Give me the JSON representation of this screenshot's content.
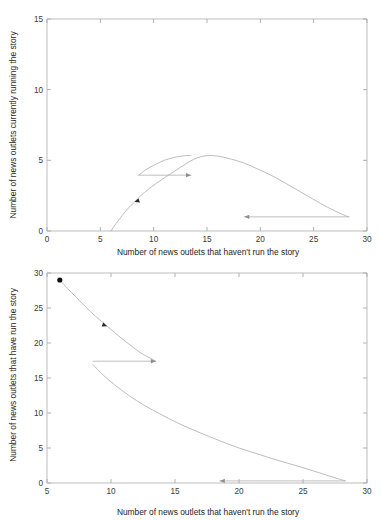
{
  "figure": {
    "background_color": "#ffffff",
    "curve_color": "#b0b0b0",
    "axis_color": "#b6b6b6",
    "marker_color": "#111111",
    "panel_count": 2
  },
  "chart_data": [
    {
      "type": "line",
      "panel": "top",
      "title": "",
      "xlabel": "Number of news outlets that haven't run the story",
      "ylabel": "Number of news outlets currently running the story",
      "xlim": [
        0,
        30
      ],
      "ylim": [
        0,
        15
      ],
      "xticks": [
        0,
        5,
        10,
        15,
        20,
        25,
        30
      ],
      "xticklabels": [
        "0",
        "5",
        "10",
        "15",
        "20",
        "25",
        "30"
      ],
      "yticks": [
        0,
        5,
        10,
        15
      ],
      "yticklabels": [
        "0",
        "5",
        "10",
        "15"
      ],
      "grid": false,
      "legend": false,
      "series": [
        {
          "name": "trajectory-rise",
          "comment": "outbreak growth branch from origin up over the hump and down to the right",
          "x": [
            6.0,
            6.3,
            6.7,
            7.1,
            7.6,
            8.2,
            8.8,
            9.5,
            10.3,
            11.2,
            12.1,
            13.0,
            14.0,
            15.0,
            16.0,
            17.2,
            18.5,
            20.0,
            21.5,
            23.0,
            24.5,
            26.0,
            27.2,
            28.0,
            28.3
          ],
          "y": [
            0.0,
            0.35,
            0.75,
            1.15,
            1.6,
            2.05,
            2.5,
            2.95,
            3.4,
            3.85,
            4.3,
            4.75,
            5.15,
            5.33,
            5.3,
            5.1,
            4.8,
            4.3,
            3.75,
            3.1,
            2.45,
            1.8,
            1.35,
            1.08,
            1.0
          ]
        },
        {
          "name": "trajectory-upper-branch",
          "comment": "second pass branch ending at the jump point",
          "x": [
            8.6,
            9.2,
            10.0,
            11.0,
            12.0,
            13.0,
            13.5
          ],
          "y": [
            3.95,
            4.3,
            4.65,
            5.0,
            5.22,
            5.33,
            5.35
          ]
        },
        {
          "name": "jump-segment-upper",
          "comment": "horizontal reset jump, rightward to leftward at y = 3.95",
          "x": [
            13.5,
            8.6
          ],
          "y": [
            3.95,
            3.95
          ]
        },
        {
          "name": "jump-segment-lower",
          "comment": "long horizontal return arrow near y = 1",
          "x": [
            28.3,
            18.5
          ],
          "y": [
            1.0,
            1.0
          ]
        }
      ],
      "annotations": [
        {
          "kind": "arrowhead",
          "x": 8.2,
          "y": 2.05,
          "direction": "down-left"
        },
        {
          "kind": "arrowhead",
          "x": 13.5,
          "y": 3.95,
          "direction": "right"
        },
        {
          "kind": "arrowhead",
          "x": 18.5,
          "y": 1.0,
          "direction": "left"
        }
      ]
    },
    {
      "type": "line",
      "panel": "bottom",
      "title": "",
      "xlabel": "Number of news outlets that haven't run the story",
      "ylabel": "Number of news outlets that have run the story",
      "xlim": [
        5,
        30
      ],
      "ylim": [
        0,
        30
      ],
      "xticks": [
        5,
        10,
        15,
        20,
        25,
        30
      ],
      "xticklabels": [
        "5",
        "10",
        "15",
        "20",
        "25",
        "30"
      ],
      "yticks": [
        0,
        5,
        10,
        15,
        20,
        25,
        30
      ],
      "yticklabels": [
        "0",
        "5",
        "10",
        "15",
        "20",
        "25",
        "30"
      ],
      "grid": false,
      "legend": false,
      "series": [
        {
          "name": "trajectory-decay-upper",
          "comment": "from the start marker down to the jump point",
          "x": [
            6.0,
            6.6,
            7.3,
            8.0,
            8.8,
            9.7,
            10.6,
            11.5,
            12.4,
            13.1,
            13.5
          ],
          "y": [
            29.0,
            27.8,
            26.5,
            25.2,
            23.8,
            22.4,
            21.0,
            19.7,
            18.5,
            17.8,
            17.4
          ]
        },
        {
          "name": "jump-segment-middle",
          "comment": "horizontal reset jump leftward at y = 17.4",
          "x": [
            13.5,
            8.6
          ],
          "y": [
            17.4,
            17.4
          ]
        },
        {
          "name": "trajectory-decay-lower",
          "comment": "long decaying tail toward the right edge",
          "x": [
            8.6,
            9.4,
            10.3,
            11.4,
            12.6,
            13.9,
            15.3,
            16.8,
            18.4,
            20.0,
            21.7,
            23.3,
            24.8,
            26.2,
            27.4,
            28.3
          ],
          "y": [
            16.9,
            15.4,
            14.0,
            12.5,
            11.1,
            9.8,
            8.5,
            7.3,
            6.1,
            5.0,
            4.0,
            3.1,
            2.3,
            1.5,
            0.8,
            0.3
          ]
        },
        {
          "name": "return-arrow-bottom",
          "comment": "horizontal return arrow near y = 0.3",
          "x": [
            28.3,
            18.5
          ],
          "y": [
            0.3,
            0.3
          ]
        }
      ],
      "annotations": [
        {
          "kind": "start-dot",
          "x": 6.0,
          "y": 29.0
        },
        {
          "kind": "arrowhead",
          "x": 9.7,
          "y": 22.4,
          "direction": "down-right"
        },
        {
          "kind": "arrowhead",
          "x": 13.5,
          "y": 17.4,
          "direction": "right"
        },
        {
          "kind": "arrowhead",
          "x": 18.5,
          "y": 0.3,
          "direction": "left"
        }
      ]
    }
  ]
}
